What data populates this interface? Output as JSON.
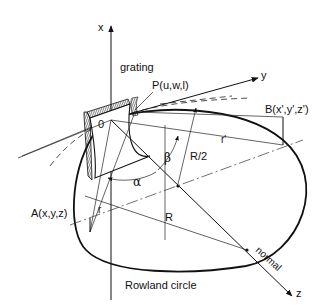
{
  "figure": {
    "title": "Rowland circle",
    "labels": {
      "x_axis": "x",
      "y_axis": "y",
      "z_axis": "z",
      "grating": "grating",
      "point_p": "P(u,w,l)",
      "origin": "0",
      "point_a": "A(x,y,z)",
      "point_b": "B(x',y',z')",
      "r": "r",
      "r_prime": "r'",
      "radius_R": "R",
      "radius_half": "R/2",
      "alpha": "α",
      "beta": "β",
      "normal": "normal",
      "rowland": "Rowland circle"
    }
  }
}
